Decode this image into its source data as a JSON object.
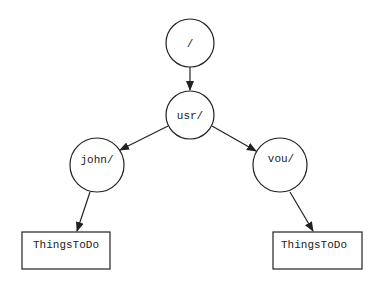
{
  "diagram": {
    "type": "directory-tree",
    "nodes": [
      {
        "id": "root",
        "label": "/",
        "shape": "circle"
      },
      {
        "id": "usr",
        "label": "usr/",
        "shape": "circle"
      },
      {
        "id": "john",
        "label": "john/",
        "shape": "circle"
      },
      {
        "id": "vou",
        "label": "vou/",
        "shape": "circle"
      },
      {
        "id": "john_file",
        "label": "ThingsToDo",
        "shape": "rectangle"
      },
      {
        "id": "vou_file",
        "label": "ThingsToDo",
        "shape": "rectangle"
      }
    ],
    "edges": [
      {
        "from": "root",
        "to": "usr"
      },
      {
        "from": "usr",
        "to": "john"
      },
      {
        "from": "usr",
        "to": "vou"
      },
      {
        "from": "john",
        "to": "john_file"
      },
      {
        "from": "vou",
        "to": "vou_file"
      }
    ],
    "colors": {
      "stroke": "#222222",
      "background": "#ffffff"
    }
  }
}
